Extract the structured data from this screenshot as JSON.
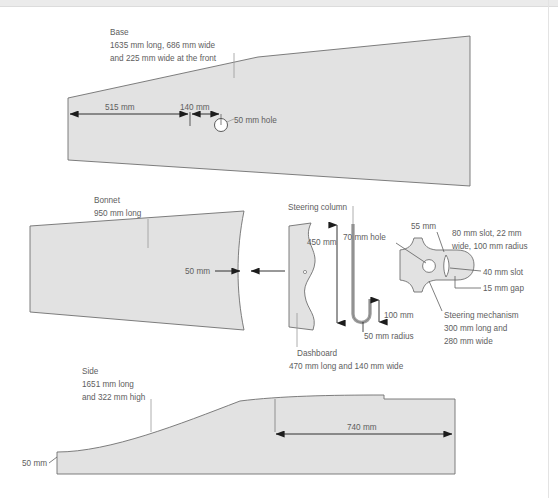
{
  "drawing": {
    "title": "Pedal car part technical drawing",
    "units": "mm",
    "style": {
      "part_fill": "#e2e2e2",
      "part_stroke": "#6f6f6f",
      "dimension_stroke": "#1c1c1c",
      "leader_stroke": "#9a9a9a",
      "text_color": "#5e5e5e",
      "background": "#ffffff",
      "top_band": "#ebebeb"
    },
    "parts": [
      {
        "id": "base",
        "name": "Base",
        "label_lines": [
          "Base",
          "1635 mm long, 686 mm wide",
          "and 225 mm wide at the front"
        ],
        "dimensions": [
          {
            "id": "base-515",
            "label": "515 mm",
            "value": 515
          },
          {
            "id": "base-140",
            "label": "140 mm",
            "value": 140
          },
          {
            "id": "base-hole",
            "label": "50 mm hole",
            "value": 50
          }
        ]
      },
      {
        "id": "bonnet",
        "name": "Bonnet",
        "label_lines": [
          "Bonnet",
          "950 mm long"
        ],
        "dimensions": [
          {
            "id": "bonnet-50",
            "label": "50 mm",
            "value": 50
          }
        ]
      },
      {
        "id": "dashboard",
        "name": "Dashboard",
        "label_lines": [
          "Dashboard",
          "470 mm long and 140 mm wide"
        ],
        "dimensions": []
      },
      {
        "id": "steering-column",
        "name": "Steering column",
        "label_lines": [
          "Steering column"
        ],
        "dimensions": [
          {
            "id": "col-450",
            "label": "450 mm",
            "value": 450
          },
          {
            "id": "col-100",
            "label": "100 mm",
            "value": 100
          },
          {
            "id": "col-50r",
            "label": "50 mm radius",
            "value": 50
          }
        ]
      },
      {
        "id": "steering-mechanism",
        "name": "Steering mechanism",
        "label_lines": [
          "Steering mechanism",
          "300 mm long and",
          "280 mm wide"
        ],
        "dimensions": [
          {
            "id": "mech-70",
            "label": "70 mm hole",
            "value": 70
          },
          {
            "id": "mech-55",
            "label": "55 mm",
            "value": 55
          },
          {
            "id": "mech-80a",
            "label": "80 mm slot, 22 mm",
            "value": 80
          },
          {
            "id": "mech-80b",
            "label": "wide, 100 mm radius",
            "value": 100
          },
          {
            "id": "mech-40",
            "label": "40 mm slot",
            "value": 40
          },
          {
            "id": "mech-15",
            "label": "15 mm gap",
            "value": 15
          }
        ]
      },
      {
        "id": "side",
        "name": "Side",
        "label_lines": [
          "Side",
          "1651 mm long",
          "and 322 mm high"
        ],
        "dimensions": [
          {
            "id": "side-50",
            "label": "50 mm",
            "value": 50
          },
          {
            "id": "side-740",
            "label": "740 mm",
            "value": 740
          }
        ]
      }
    ]
  },
  "labels": {
    "base_l1": "Base",
    "base_l2": "1635 mm long, 686 mm wide",
    "base_l3": "and 225 mm wide at the front",
    "base_515": "515 mm",
    "base_140": "140 mm",
    "base_hole": "50 mm hole",
    "bonnet_l1": "Bonnet",
    "bonnet_l2": "950 mm long",
    "bonnet_50": "50 mm",
    "steering_column": "Steering column",
    "col_450": "450 mm",
    "col_100": "100 mm",
    "col_50r": "50 mm radius",
    "dash_l1": "Dashboard",
    "dash_l2": "470 mm long and 140 mm wide",
    "mech_70": "70 mm hole",
    "mech_55": "55 mm",
    "mech_80a": "80 mm slot, 22 mm",
    "mech_80b": "wide, 100 mm radius",
    "mech_40": "40 mm slot",
    "mech_15": "15 mm gap",
    "mech_l1": "Steering mechanism",
    "mech_l2": "300 mm long and",
    "mech_l3": "280 mm wide",
    "side_l1": "Side",
    "side_l2": "1651 mm long",
    "side_l3": "and 322 mm high",
    "side_50": "50 mm",
    "side_740": "740 mm"
  }
}
